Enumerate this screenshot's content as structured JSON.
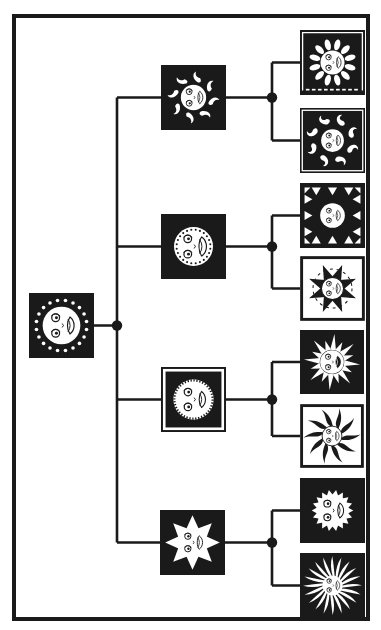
{
  "figure": {
    "kind": "tree-diagram",
    "ink_color": "#1a1a1a",
    "paper_color": "#ffffff"
  },
  "tree": {
    "root": {
      "id": "root",
      "variant": "dotted-ring-sun"
    },
    "branches": [
      {
        "id": "branch-1",
        "variant": "flame-swirl-sun",
        "leaves": [
          {
            "id": "leaf-1-1",
            "variant": "petal-ray-sun"
          },
          {
            "id": "leaf-1-2",
            "variant": "wave-scroll-sun"
          }
        ]
      },
      {
        "id": "branch-2",
        "variant": "dotted-circle-sun",
        "leaves": [
          {
            "id": "leaf-2-1",
            "variant": "inward-triangle-sun"
          },
          {
            "id": "leaf-2-2",
            "variant": "compass-star-sun"
          }
        ]
      },
      {
        "id": "branch-3",
        "variant": "serrated-disc-sun",
        "leaves": [
          {
            "id": "leaf-3-1",
            "variant": "spike-ray-sun"
          },
          {
            "id": "leaf-3-2",
            "variant": "wavy-ray-sun"
          }
        ]
      },
      {
        "id": "branch-4",
        "variant": "triangle-point-sun",
        "leaves": [
          {
            "id": "leaf-4-1",
            "variant": "sawtooth-sun"
          },
          {
            "id": "leaf-4-2",
            "variant": "pinwheel-sun"
          }
        ]
      }
    ]
  }
}
